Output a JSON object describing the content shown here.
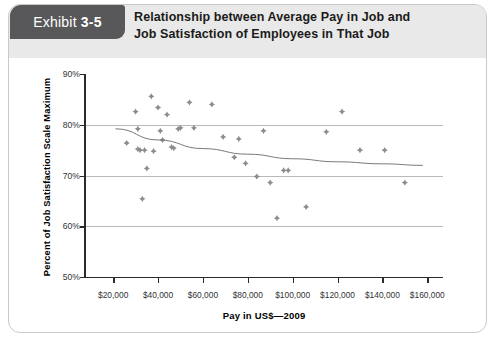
{
  "exhibit": {
    "prefix": "Exhibit",
    "number": "3-5"
  },
  "title": {
    "line1": "Relationship between Average Pay in Job and",
    "line2": "Job Satisfaction of Employees in That Job"
  },
  "colors": {
    "tab_background": "#58585a",
    "header_band": "#e9e9e9",
    "marker": "#8c8c8c",
    "trendline": "#7a7a7a",
    "gridline": "#b9b9b9",
    "axis": "#2b2b2b",
    "card_border": "#c9c9c9"
  },
  "chart_data": {
    "type": "scatter",
    "title": "Relationship between Average Pay in Job and Job Satisfaction of Employees in That Job",
    "xlabel": "Pay in US$—2009",
    "ylabel": "Percent of Job Satisfaction Scale Maximum",
    "xlim": [
      7000,
      167000
    ],
    "ylim": [
      50,
      90
    ],
    "xticks": [
      20000,
      40000,
      60000,
      80000,
      100000,
      120000,
      140000,
      160000
    ],
    "xticklabels": [
      "$20,000",
      "$40,000",
      "$60,000",
      "$80,000",
      "$100,000",
      "$120,000",
      "$140,000",
      "$160,000"
    ],
    "yticks": [
      50,
      60,
      70,
      80,
      90
    ],
    "yticklabels": [
      "50%",
      "60%",
      "70%",
      "80%",
      "90%"
    ],
    "grid": "horizontal",
    "legend": "none",
    "points": [
      {
        "x": 26000,
        "y": 76.4
      },
      {
        "x": 30000,
        "y": 82.6
      },
      {
        "x": 31000,
        "y": 75.2
      },
      {
        "x": 31000,
        "y": 79.2
      },
      {
        "x": 32000,
        "y": 75.0
      },
      {
        "x": 33000,
        "y": 65.4
      },
      {
        "x": 34000,
        "y": 75.0
      },
      {
        "x": 35000,
        "y": 71.4
      },
      {
        "x": 37000,
        "y": 85.6
      },
      {
        "x": 38000,
        "y": 74.8
      },
      {
        "x": 40000,
        "y": 83.4
      },
      {
        "x": 41000,
        "y": 78.8
      },
      {
        "x": 42000,
        "y": 77.0
      },
      {
        "x": 44000,
        "y": 82.0
      },
      {
        "x": 46000,
        "y": 75.6
      },
      {
        "x": 47000,
        "y": 75.4
      },
      {
        "x": 49000,
        "y": 79.2
      },
      {
        "x": 50000,
        "y": 79.4
      },
      {
        "x": 54000,
        "y": 84.4
      },
      {
        "x": 56000,
        "y": 79.4
      },
      {
        "x": 64000,
        "y": 84.0
      },
      {
        "x": 69000,
        "y": 77.6
      },
      {
        "x": 74000,
        "y": 73.6
      },
      {
        "x": 76000,
        "y": 77.2
      },
      {
        "x": 79000,
        "y": 72.4
      },
      {
        "x": 84000,
        "y": 69.8
      },
      {
        "x": 87000,
        "y": 78.8
      },
      {
        "x": 90000,
        "y": 68.6
      },
      {
        "x": 93000,
        "y": 61.6
      },
      {
        "x": 96000,
        "y": 71.0
      },
      {
        "x": 98000,
        "y": 71.0
      },
      {
        "x": 106000,
        "y": 63.8
      },
      {
        "x": 115000,
        "y": 78.6
      },
      {
        "x": 122000,
        "y": 82.6
      },
      {
        "x": 130000,
        "y": 75.0
      },
      {
        "x": 141000,
        "y": 75.0
      },
      {
        "x": 150000,
        "y": 68.6
      }
    ],
    "trendline": {
      "description": "downward sloping fitted curve",
      "points": [
        {
          "x": 21000,
          "y": 79.2
        },
        {
          "x": 40000,
          "y": 77.0
        },
        {
          "x": 60000,
          "y": 75.3
        },
        {
          "x": 80000,
          "y": 74.2
        },
        {
          "x": 100000,
          "y": 73.3
        },
        {
          "x": 120000,
          "y": 72.7
        },
        {
          "x": 140000,
          "y": 72.3
        },
        {
          "x": 158000,
          "y": 72.0
        }
      ]
    }
  }
}
